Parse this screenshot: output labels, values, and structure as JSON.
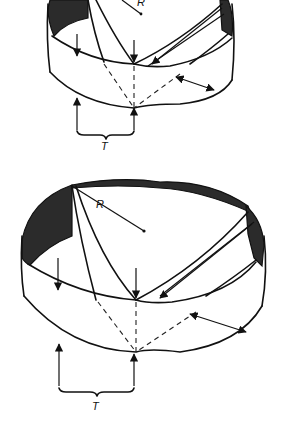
{
  "figure": {
    "type": "diagram",
    "colors": {
      "line": "#111111",
      "shade": "#2b2b2b",
      "background": "#ffffff"
    },
    "diagrams": [
      {
        "id": "top-view",
        "labels": {
          "radius": "R",
          "width": "T"
        }
      },
      {
        "id": "bottom-view",
        "labels": {
          "radius": "R",
          "width": "T"
        }
      }
    ]
  }
}
